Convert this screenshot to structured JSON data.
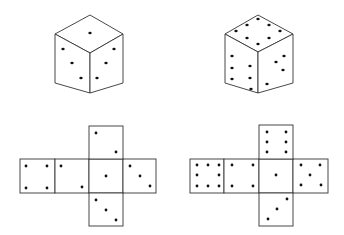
{
  "figure": {
    "colors": {
      "line": "#333333",
      "pip": "#111111",
      "background": "#ffffff"
    },
    "cubes": [
      {
        "id": "cube-left",
        "vertices": {
          "top": [
            90,
            15
          ],
          "left": [
            55,
            34
          ],
          "right": [
            123,
            34
          ],
          "center": [
            90,
            53
          ],
          "bottom_left": [
            55,
            83
          ],
          "bottom": [
            90,
            93
          ],
          "bottom_right": [
            123,
            83
          ]
        },
        "faces": {
          "top": 1,
          "left": 3,
          "right": 3
        },
        "pips": [
          [
            90,
            33
          ],
          [
            63,
            49
          ],
          [
            72,
            63
          ],
          [
            81,
            78
          ],
          [
            114,
            49
          ],
          [
            106,
            63
          ],
          [
            97,
            78
          ]
        ]
      },
      {
        "id": "cube-right",
        "vertices": {
          "top": [
            258,
            15
          ],
          "left": [
            225,
            34
          ],
          "right": [
            293,
            34
          ],
          "center": [
            258,
            52
          ],
          "bottom_left": [
            225,
            83
          ],
          "bottom": [
            258,
            93
          ],
          "bottom_right": [
            293,
            83
          ]
        },
        "faces": {
          "top": 6,
          "left": 6,
          "right": 4
        },
        "pips": [
          [
            258,
            19
          ],
          [
            247,
            25
          ],
          [
            269,
            25
          ],
          [
            236,
            31
          ],
          [
            280,
            31
          ],
          [
            247,
            38
          ],
          [
            269,
            38
          ],
          [
            258,
            44
          ],
          [
            232,
            56
          ],
          [
            232,
            68
          ],
          [
            232,
            79
          ],
          [
            250,
            66
          ],
          [
            250,
            78
          ],
          [
            251,
            89
          ],
          [
            284,
            56
          ],
          [
            276,
            62
          ],
          [
            283,
            70
          ],
          [
            267,
            84
          ]
        ]
      }
    ],
    "nets": [
      {
        "id": "net-left",
        "faces": [
          {
            "name": "face-left-1",
            "x": 20,
            "y": 159,
            "w": 35,
            "h": 34,
            "value": 4,
            "pips": [
              [
                26,
                166
              ],
              [
                47,
                166
              ],
              [
                26,
                188
              ],
              [
                47,
                188
              ]
            ]
          },
          {
            "name": "face-left-2",
            "x": 55,
            "y": 159,
            "w": 34,
            "h": 34,
            "value": 2,
            "pips": [
              [
                61,
                166
              ],
              [
                82,
                187
              ]
            ]
          },
          {
            "name": "face-center",
            "x": 89,
            "y": 159,
            "w": 34,
            "h": 34,
            "value": 1,
            "pips": [
              [
                106,
                176
              ]
            ]
          },
          {
            "name": "face-right",
            "x": 123,
            "y": 159,
            "w": 33,
            "h": 34,
            "value": 3,
            "pips": [
              [
                130,
                166
              ],
              [
                140,
                176
              ],
              [
                150,
                186
              ]
            ]
          },
          {
            "name": "face-top",
            "x": 89,
            "y": 126,
            "w": 34,
            "h": 33,
            "value": 2,
            "pips": [
              [
                96,
                133
              ],
              [
                116,
                152
              ]
            ]
          },
          {
            "name": "face-bottom",
            "x": 89,
            "y": 193,
            "w": 34,
            "h": 33,
            "value": 3,
            "pips": [
              [
                96,
                200
              ],
              [
                106,
                210
              ],
              [
                116,
                220
              ]
            ]
          }
        ]
      },
      {
        "id": "net-right",
        "faces": [
          {
            "name": "face-left-1",
            "x": 190,
            "y": 159,
            "w": 34,
            "h": 34,
            "value": 8,
            "pips": [
              [
                197,
                165
              ],
              [
                208,
                165
              ],
              [
                219,
                165
              ],
              [
                197,
                175
              ],
              [
                219,
                175
              ],
              [
                197,
                186
              ],
              [
                208,
                186
              ],
              [
                219,
                186
              ]
            ]
          },
          {
            "name": "face-left-2",
            "x": 224,
            "y": 159,
            "w": 35,
            "h": 34,
            "value": 4,
            "pips": [
              [
                232,
                165
              ],
              [
                253,
                165
              ],
              [
                232,
                186
              ],
              [
                253,
                186
              ]
            ]
          },
          {
            "name": "face-center",
            "x": 259,
            "y": 159,
            "w": 34,
            "h": 34,
            "value": 1,
            "pips": [
              [
                276,
                175
              ]
            ]
          },
          {
            "name": "face-right",
            "x": 293,
            "y": 159,
            "w": 35,
            "h": 34,
            "value": 5,
            "pips": [
              [
                301,
                165
              ],
              [
                320,
                165
              ],
              [
                310,
                175
              ],
              [
                301,
                185
              ],
              [
                321,
                185
              ]
            ]
          },
          {
            "name": "face-top",
            "x": 259,
            "y": 125,
            "w": 34,
            "h": 34,
            "value": 6,
            "pips": [
              [
                267,
                132
              ],
              [
                286,
                132
              ],
              [
                267,
                142
              ],
              [
                286,
                142
              ],
              [
                267,
                152
              ],
              [
                286,
                152
              ]
            ]
          },
          {
            "name": "face-bottom",
            "x": 259,
            "y": 193,
            "w": 34,
            "h": 33,
            "value": 3,
            "pips": [
              [
                287,
                199
              ],
              [
                277,
                209
              ],
              [
                268,
                219
              ]
            ]
          }
        ]
      }
    ]
  }
}
